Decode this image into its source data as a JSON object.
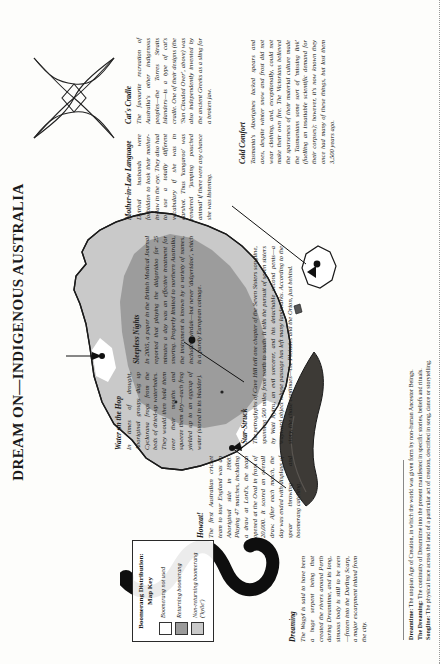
{
  "page": {
    "title_main": "Dream On",
    "title_dash": "—",
    "title_sub": "Indigenous Australia"
  },
  "legend": {
    "title_line1": "Boomerang Distribution:",
    "title_line2": "Map Key",
    "items": [
      {
        "label": "Boomerang not used",
        "color": "#ffffff"
      },
      {
        "label": "Returning boomerang",
        "color": "#9a9a9a"
      },
      {
        "label": "Non-returning boomerang ('kylie')",
        "color": "#c9c9c9"
      }
    ]
  },
  "articles": [
    {
      "id": "cats-cradle",
      "heading": "Cat's Cradle",
      "body": "The favourite recreation of Australia's other indigenous peoples—the Torres Straits Islanders—is a type of cat's cradle. One of their designs (the 'Sun Clouded Over', above) was also independently invented by the ancient Greeks as a sling for a broken jaw."
    },
    {
      "id": "mother-in-law",
      "heading": "Mother-in-Law Language",
      "body": "Dyirbal husbands were forbidden to look their mother-in-law in the eye. They also had to use a totally different vocabulary if she was in earshot. Thus 'kangaroo' was rendered 'jumping pouched animal' if there were any chance she was listening."
    },
    {
      "id": "cold-comfort",
      "heading": "Cold Comfort",
      "body": "Tasmania's Aborigines lacked spears and axes, despite winter snow and frost did not wear clothing, and, exceptionally, could not make their own fire. The Victorians believed the sparseness of their material culture made the Tasmanians some sort of 'missing link' (fuelling an insatiable scientific demand for their corpses); however, it's now known they once had many of these things, but lost them 3,500 years ago."
    },
    {
      "id": "sleepless-nights",
      "heading": "Sleepless Nights",
      "body": "In 2005, a paper in the British Medical Journal reported that playing the didgeridoo for 25 minutes a day was an effective treatment for snoring. Properly limited to northern Australia, the instrument is known by a variety of names, including yirdak—but never 'didgeridoo', which is a purely European coinage."
    },
    {
      "id": "water-on-the-hop",
      "heading": "Water on the Hop",
      "body": "In times of drought, Aboriginal groups dug up Cyclorana frogs from the beds of dried-up waterholes. They would then hold them over their mouths and squeeze them dry—each frog yielded up to an eggcup of water (stored in its bladder)."
    },
    {
      "id": "star-struck",
      "heading": "Star-Struck",
      "body": "The petroglyphs of Cave Hill tell one chapter of the Seven Sisters songline, spanning 500 miles from north to south. It tells the pursuit of seven sisters by Wati Nyiru, an evil sorcerer, and his detachable second penis—a wayward object whose passage has left many landmarks. According to the story, the chase continues—the Pleiades and the Orion, just behind."
    },
    {
      "id": "howzat",
      "heading": "Howzat!",
      "body": "The first Australian cricket team to tour England was an Aboriginal side in 1868. Playing 47 matches, including a draw at Lord's, the team opened at the Oval in front of 20,000. It scored an overall draw. After each match, the day was ended with displays of spear throwing and boomerang catching."
    },
    {
      "id": "dreaming",
      "heading": "Dreaming",
      "body": "The Wagyl is said to have been a huge serpent being that created the rivers around Perth during Dreamtime, and its long, sinuous body is still to be seen—frozen into the Darling Scarp, a major escarpment inland from the city."
    }
  ],
  "glossary": [
    {
      "term": "Dreamtime:",
      "def": "The utopian Age of Creation, in which the world was given form by non-human Ancestor Beings."
    },
    {
      "term": "The Dreaming:",
      "def": "The continuity of Dreamtime into the present manifested in specific stories, beliefs and rituals."
    },
    {
      "term": "Songline:",
      "def": "The physical trace across the land of a particular act of creation, described in song, dance or storytelling."
    }
  ],
  "map": {
    "name": "australia-map",
    "markers": [
      "cave-hill-site",
      "perth-site",
      "lords-site",
      "tasmania-site"
    ],
    "shade_returning": "#9a9a9a",
    "shade_nonreturning": "#c9c9c9",
    "shade_none": "#ffffff"
  },
  "illustrations": [
    {
      "name": "string-figure-cats-cradle"
    },
    {
      "name": "boomerang"
    },
    {
      "name": "wagyl-serpent"
    }
  ]
}
